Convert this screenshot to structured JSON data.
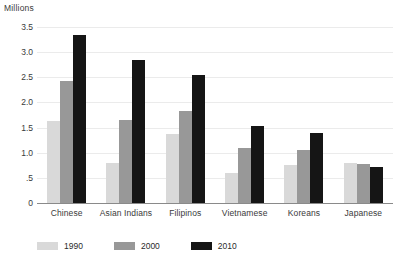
{
  "chart_data": {
    "type": "bar",
    "title": "",
    "axis_title": "Millions",
    "xlabel": "",
    "ylabel": "Millions",
    "ylim": [
      0,
      3.5
    ],
    "ytick_labels": [
      "3.5",
      "3.0",
      "2.5",
      "2.0",
      "1.5",
      "1.0",
      ".5",
      "0"
    ],
    "ytick_values": [
      3.5,
      3.0,
      2.5,
      2.0,
      1.5,
      1.0,
      0.5,
      0
    ],
    "grid": true,
    "grid_axis": "y",
    "legend_position": "bottom-left",
    "categories": [
      "Chinese",
      "Asian Indians",
      "Filipinos",
      "Vietnamese",
      "Koreans",
      "Japanese"
    ],
    "series": [
      {
        "name": "1990",
        "color": "#d9d9d9",
        "values": [
          1.63,
          0.79,
          1.38,
          0.59,
          0.75,
          0.8
        ]
      },
      {
        "name": "2000",
        "color": "#989898",
        "values": [
          2.43,
          1.66,
          1.82,
          1.09,
          1.05,
          0.78
        ]
      },
      {
        "name": "2010",
        "color": "#151515",
        "values": [
          3.35,
          2.84,
          2.54,
          1.53,
          1.4,
          0.72
        ]
      }
    ]
  }
}
